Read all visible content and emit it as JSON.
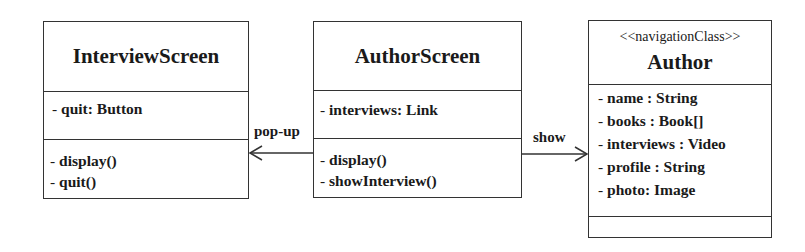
{
  "diagram": {
    "type": "UML class diagram",
    "classes": [
      {
        "id": "interview_screen",
        "name": "InterviewScreen",
        "stereotype": null,
        "attributes": [
          {
            "prefix": "-",
            "text": "quit: Button"
          }
        ],
        "methods": [
          {
            "prefix": "-",
            "text": "display()"
          },
          {
            "prefix": "-",
            "text": "quit()"
          }
        ]
      },
      {
        "id": "author_screen",
        "name": "AuthorScreen",
        "stereotype": null,
        "attributes": [
          {
            "prefix": "-",
            "text": "interviews: Link"
          }
        ],
        "methods": [
          {
            "prefix": "-",
            "text": "display()"
          },
          {
            "prefix": "-",
            "text": "showInterview()"
          }
        ]
      },
      {
        "id": "author",
        "name": "Author",
        "stereotype": "<<navigationClass>>",
        "attributes": [
          {
            "prefix": "-",
            "text": "name : String"
          },
          {
            "prefix": "-",
            "text": "books : Book[]"
          },
          {
            "prefix": "-",
            "text": "interviews : Video"
          },
          {
            "prefix": "-",
            "text": "profile : String"
          },
          {
            "prefix": "-",
            "text": "photo: Image"
          }
        ],
        "methods": []
      }
    ],
    "associations": [
      {
        "from": "AuthorScreen",
        "to": "InterviewScreen",
        "label": "pop-up",
        "arrow": "open"
      },
      {
        "from": "AuthorScreen",
        "to": "Author",
        "label": "show",
        "arrow": "open"
      }
    ],
    "colors": {
      "line": "#333333",
      "text": "#1a1a1a",
      "background": "#ffffff"
    }
  }
}
